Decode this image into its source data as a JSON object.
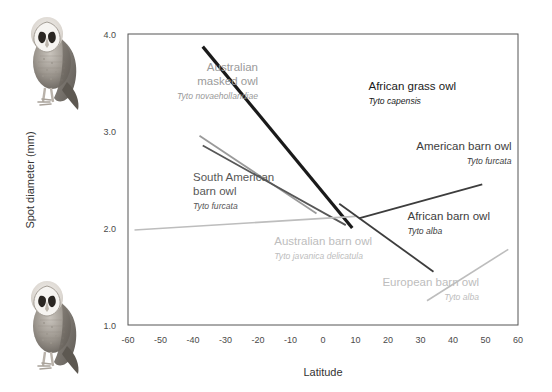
{
  "figure": {
    "title": "",
    "background": "#ffffff",
    "decorations": [
      {
        "name": "barn-owl-illustration-top",
        "description": "barn owl illustration"
      },
      {
        "name": "barn-owl-illustration-bottom",
        "description": "barn owl illustration"
      }
    ]
  },
  "chart_data": {
    "type": "line",
    "title": "",
    "xlabel": "Latitude",
    "ylabel": "Spot diameter (mm)",
    "xlim": [
      -60,
      60
    ],
    "ylim": [
      1.0,
      4.0
    ],
    "xticks": [
      -60,
      -50,
      -40,
      -30,
      -20,
      -10,
      0,
      10,
      20,
      30,
      40,
      50,
      60
    ],
    "xticklabels": [
      "-60",
      "-50",
      "-40",
      "-30",
      "-20",
      "-10",
      "0",
      "10",
      "20",
      "30",
      "40",
      "50",
      "60"
    ],
    "yticks": [
      1.0,
      2.0,
      3.0,
      4.0
    ],
    "yticklabels": [
      "1.0",
      "2.0",
      "3.0",
      "4.0"
    ],
    "grid": false,
    "legend": "inline-annotations",
    "series": [
      {
        "name": "African grass owl",
        "scientific_name": "Tyto capensis",
        "color": "#1a1a1a",
        "width": 3.2,
        "x": [
          -37,
          9
        ],
        "y": [
          3.87,
          2.0
        ],
        "label_x": 14,
        "label_y": 3.42,
        "label_align": "start"
      },
      {
        "name": "Australian masked owl",
        "scientific_name": "Tyto novaehollandiae",
        "color": "#9a9a9a",
        "width": 1.8,
        "x": [
          -38,
          -2
        ],
        "y": [
          2.95,
          2.15
        ],
        "label_x": -20,
        "label_y": 3.62,
        "label_align": "end"
      },
      {
        "name": "South American barn owl",
        "scientific_name": "Tyto furcata",
        "color": "#575757",
        "width": 1.8,
        "x": [
          -37,
          7
        ],
        "y": [
          2.85,
          2.03
        ],
        "label_x": -40,
        "label_y": 2.48,
        "label_align": "start"
      },
      {
        "name": "Australian barn owl",
        "scientific_name": "Tyto javanica delicatula",
        "color": "#bdbdbd",
        "width": 1.6,
        "x": [
          -58,
          10
        ],
        "y": [
          1.98,
          2.12
        ],
        "label_x": -15,
        "label_y": 1.82,
        "label_align": "start"
      },
      {
        "name": "American barn owl",
        "scientific_name": "Tyto furcata",
        "color": "#3d3d3d",
        "width": 1.8,
        "x": [
          11,
          49
        ],
        "y": [
          2.1,
          2.45
        ],
        "label_x": 58,
        "label_y": 2.8,
        "label_align": "end"
      },
      {
        "name": "African barn owl",
        "scientific_name": "Tyto alba",
        "color": "#3d3d3d",
        "width": 1.8,
        "x": [
          5,
          34
        ],
        "y": [
          2.25,
          1.55
        ],
        "label_x": 26,
        "label_y": 2.08,
        "label_align": "start"
      },
      {
        "name": "European barn owl",
        "scientific_name": "Tyto alba",
        "color": "#bdbdbd",
        "width": 1.6,
        "x": [
          32,
          57
        ],
        "y": [
          1.25,
          1.78
        ],
        "label_x": 48,
        "label_y": 1.4,
        "label_align": "end"
      }
    ]
  }
}
